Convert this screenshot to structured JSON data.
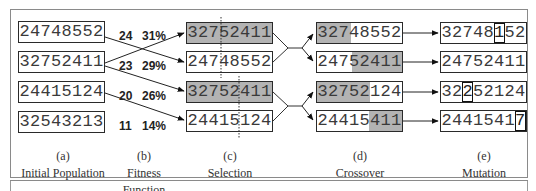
{
  "figure": {
    "stages": [
      {
        "letter": "(a)",
        "title": "Initial Population"
      },
      {
        "letter": "(b)",
        "title": "Fitness Function"
      },
      {
        "letter": "(c)",
        "title": "Selection"
      },
      {
        "letter": "(d)",
        "title": "Crossover"
      },
      {
        "letter": "(e)",
        "title": "Mutation"
      }
    ],
    "initial_population": [
      "24748552",
      "32752411",
      "24415124",
      "32543213"
    ],
    "fitness": [
      {
        "score": "24",
        "percent": "31%"
      },
      {
        "score": "23",
        "percent": "29%"
      },
      {
        "score": "20",
        "percent": "26%"
      },
      {
        "score": "11",
        "percent": "14%"
      }
    ],
    "selection": [
      {
        "value": "32752411",
        "shaded": true,
        "crossover_point": 3
      },
      {
        "value": "24748552",
        "shaded": false,
        "crossover_point": 3
      },
      {
        "value": "32752411",
        "shaded": true,
        "crossover_point": 5
      },
      {
        "value": "24415124",
        "shaded": false,
        "crossover_point": 5
      }
    ],
    "selection_links": [
      [
        1,
        0
      ],
      [
        0,
        1
      ],
      [
        1,
        2
      ],
      [
        2,
        3
      ]
    ],
    "crossover": [
      {
        "value": "32748552",
        "shaded_digits": "first",
        "shaded_count": 3
      },
      {
        "value": "24752411",
        "shaded_digits": "last",
        "shaded_count": 5
      },
      {
        "value": "32752124",
        "shaded_digits": "first",
        "shaded_count": 5
      },
      {
        "value": "24415411",
        "shaded_digits": "last",
        "shaded_count": 3
      }
    ],
    "mutation": [
      {
        "value": "32748152",
        "mutated_index": 5
      },
      {
        "value": "24752411",
        "mutated_index": null
      },
      {
        "value": "32252124",
        "mutated_index": 2
      },
      {
        "value": "24415417",
        "mutated_index": 7
      }
    ],
    "colors": {
      "shade": "#b3b3b3",
      "border": "#2a2a2a",
      "text": "#3a3a3a"
    }
  }
}
